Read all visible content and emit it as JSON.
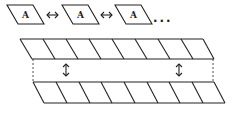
{
  "top_row": {
    "cells": [
      {
        "label": "A"
      },
      {
        "label": "A"
      },
      {
        "label": "A"
      }
    ],
    "connector_icon": "double-arrow-horizontal",
    "ellipsis": "..."
  },
  "bands": {
    "top_band_cells": 8,
    "bottom_band_cells": 8,
    "connector_icon": "double-arrow-vertical",
    "connector_count": 2
  },
  "colors": {
    "stroke": "#222222",
    "background": "#ffffff"
  }
}
